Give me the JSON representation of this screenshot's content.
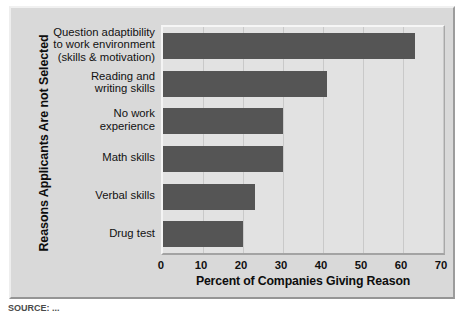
{
  "chart_data": {
    "type": "bar",
    "orientation": "horizontal",
    "title": "",
    "xlabel": "Percent of Companies Giving Reason",
    "ylabel": "Reasons Applicants Are not Selected",
    "xlim": [
      0,
      70
    ],
    "xticks": [
      0,
      10,
      20,
      30,
      40,
      50,
      60,
      70
    ],
    "grid": true,
    "legend": "none",
    "bar_color": "#555555",
    "plot_background": "#e2e2e2",
    "figure_background": "#d9d9d9",
    "categories": [
      "Question adaptibility to work environment (skills & motivation)",
      "Reading and writing skills",
      "No work experience",
      "Math skills",
      "Verbal skills",
      "Drug test"
    ],
    "category_lines": [
      [
        "Question adaptibility",
        "to work environment",
        "(skills & motivation)"
      ],
      [
        "Reading and",
        "writing skills"
      ],
      [
        "No work",
        "experience"
      ],
      [
        "Math skills"
      ],
      [
        "Verbal skills"
      ],
      [
        "Drug test"
      ]
    ],
    "values": [
      63,
      41,
      30,
      30,
      23,
      20
    ]
  },
  "source": {
    "note": "SOURCE: ..."
  }
}
